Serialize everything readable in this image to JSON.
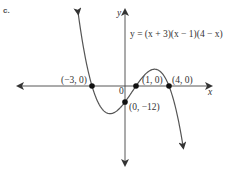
{
  "part_label": "c.",
  "chart_data": {
    "type": "line",
    "title": "",
    "equation": "y = (x + 3)(x − 1)(4 − x)",
    "xlabel": "x",
    "ylabel": "y",
    "origin_label": "0",
    "function": "(x+3)(x-1)(4-x)",
    "x_range": [
      -4.3,
      5.3
    ],
    "y_range": [
      -58,
      56
    ],
    "grid": false,
    "key_points": [
      {
        "x": -3,
        "y": 0,
        "label": "(−3, 0)"
      },
      {
        "x": 1,
        "y": 0,
        "label": "(1, 0)"
      },
      {
        "x": 4,
        "y": 0,
        "label": "(4, 0)"
      },
      {
        "x": 0,
        "y": -12,
        "label": "(0, −12)"
      }
    ],
    "color": "#555555"
  }
}
